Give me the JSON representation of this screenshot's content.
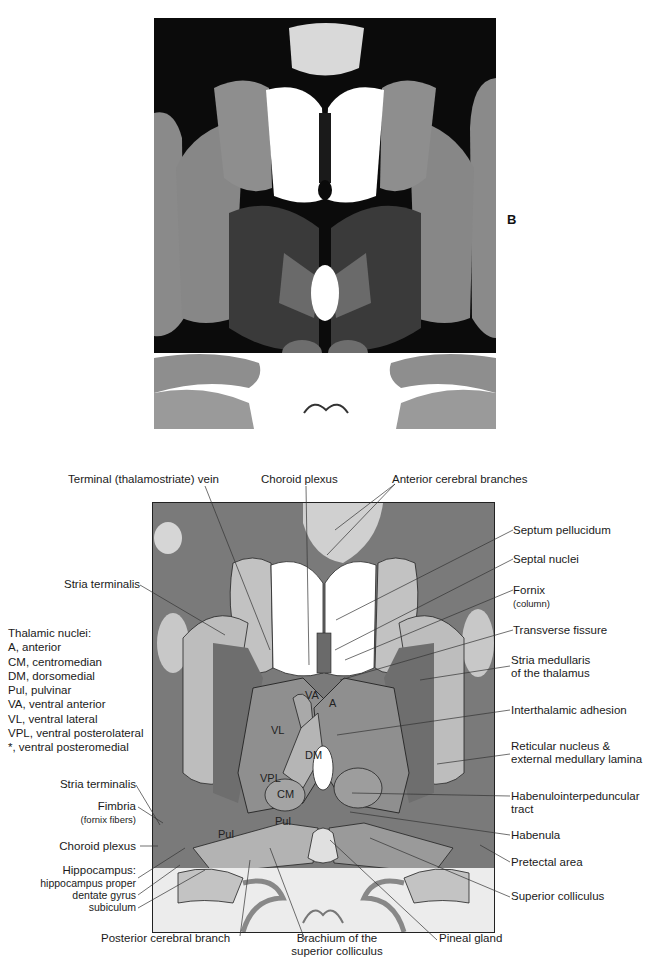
{
  "figure": {
    "panel_letter": "B",
    "photo": {
      "description": "myelin-stained horizontal brain section through thalamus"
    },
    "diagram": {
      "labels_top": [
        {
          "id": "terminal-vein",
          "text": "Terminal (thalamostriate) vein"
        },
        {
          "id": "choroid-plexus-top",
          "text": "Choroid plexus"
        },
        {
          "id": "anterior-cerebral-branches",
          "text": "Anterior cerebral branches"
        }
      ],
      "labels_right": [
        {
          "id": "septum-pellucidum",
          "text": "Septum pellucidum"
        },
        {
          "id": "septal-nuclei",
          "text": "Septal nuclei"
        },
        {
          "id": "fornix",
          "text": "Fornix",
          "sub": "(column)"
        },
        {
          "id": "transverse-fissure",
          "text": "Transverse fissure"
        },
        {
          "id": "stria-medullaris",
          "line1": "Stria medullaris",
          "line2": "of the thalamus"
        },
        {
          "id": "interthalamic-adhesion",
          "text": "Interthalamic adhesion"
        },
        {
          "id": "reticular-nucleus",
          "line1": "Reticular nucleus &",
          "line2": "external medullary lamina"
        },
        {
          "id": "habenulointerpeduncular",
          "line1": "Habenulointerpeduncular",
          "line2": "tract"
        },
        {
          "id": "habenula",
          "text": "Habenula"
        },
        {
          "id": "pretectal-area",
          "text": "Pretectal area"
        },
        {
          "id": "superior-colliculus",
          "text": "Superior colliculus"
        }
      ],
      "labels_left": [
        {
          "id": "stria-terminalis-1",
          "text": "Stria terminalis"
        },
        {
          "id": "stria-terminalis-2",
          "text": "Stria terminalis"
        },
        {
          "id": "fimbria",
          "text": "Fimbria",
          "sub": "(fornix fibers)"
        },
        {
          "id": "choroid-plexus-left",
          "text": "Choroid plexus"
        },
        {
          "id": "hippocampus",
          "text": "Hippocampus:",
          "parts": [
            "hippocampus proper",
            "dentate gyrus",
            "subiculum"
          ]
        }
      ],
      "labels_bottom": [
        {
          "id": "posterior-cerebral-branch",
          "text": "Posterior cerebral branch"
        },
        {
          "id": "brachium",
          "line1": "Brachium of the",
          "line2": "superior colliculus"
        },
        {
          "id": "pineal-gland",
          "text": "Pineal gland"
        }
      ],
      "nuclei_in_diagram": [
        "VA",
        "A",
        "VL",
        "DM",
        "VPL",
        "CM",
        "Pul",
        "Pul"
      ],
      "legend": {
        "title": "Thalamic nuclei:",
        "items": [
          "A, anterior",
          "CM, centromedian",
          "DM, dorsomedial",
          "Pul, pulvinar",
          "VA, ventral anterior",
          "VL, ventral lateral",
          "VPL, ventral posterolateral",
          "*, ventral posteromedial"
        ]
      }
    }
  }
}
